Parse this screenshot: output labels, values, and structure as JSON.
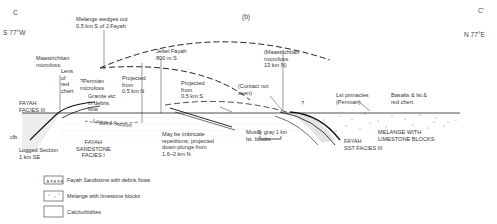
{
  "figure": {
    "panel_label": "(b)",
    "left_end": {
      "label": "C",
      "bearing": "S 77°W"
    },
    "right_end": {
      "label": "C'",
      "bearing": "N 77°E"
    }
  },
  "annotations": {
    "melange_wedges": "Melange wedges out\n0.5 km S of J.Fayah",
    "maastrichtian_left": "Maastrichtian\nmicrofoss.",
    "lens_chert": "Lens\nof\nred\nchert",
    "permian_microfoss": "?Permian\nmicrofoss",
    "granite_debris": "Granite etc\nin debris\nflow",
    "projected_n": "Projected\nfrom\n0.5 km N",
    "jebel_fayah": "Jebel Fayah\n800 m S",
    "projected_s": "Projected\nfrom\n0.5 km S",
    "maastrichtian_right": "(Maastrichtian\nmicrofoss.\n13 km N)",
    "contact_not_seen": "(Contact not\nseen)",
    "lst_pinnacles": "Lst pinnacles\n(Permian)",
    "basalts": "Basalts & lst &\nred chert",
    "fayah_facies_iii": "FAYAH\nFACIES III",
    "clb": "clb",
    "logged_section_se": "Logged Section\n1 km SE",
    "logged_section": "Logged Section",
    "fayah_sandstone_i": "FAYAH\nSANDSTONE\nFACIES I",
    "imbricate": "May be imbricate\nrepetitions; projected\ndown-plunge from\n1.6–2 km N",
    "mostly_gray": "Mostly gray\nlst. blocks",
    "qq": "?",
    "melange_blocks": "MELANGE WITH\nLIMESTONE BLOCKS",
    "fayah_sst_iii": "FAYAH\nSST FACIES III",
    "band_labels": [
      "Calc. sst. & lst.",
      "Sst. calc. ssl. & calc."
    ]
  },
  "scale_bar": {
    "start": "0",
    "end": "1 km"
  },
  "legend": [
    {
      "symbol": "debris-flow-pattern",
      "label": "Fayah Sandstone with debris flows"
    },
    {
      "symbol": "dotted-pattern",
      "label": "Melange with limestone blocks"
    },
    {
      "symbol": "blank-box",
      "label": "Calciturbidites"
    }
  ]
}
